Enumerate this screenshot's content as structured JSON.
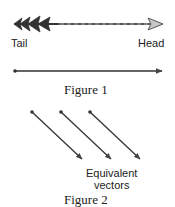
{
  "figure1": {
    "arrow_labels": {
      "tail": "Tail",
      "head": "Head"
    },
    "caption": "Figure 1"
  },
  "figure2": {
    "annotation_line1": "Equivalent",
    "annotation_line2": "vectors",
    "caption": "Figure 2"
  },
  "colors": {
    "ink": "#333333",
    "arrowhead_fill": "#c8c8c8",
    "background": "#ffffff"
  }
}
